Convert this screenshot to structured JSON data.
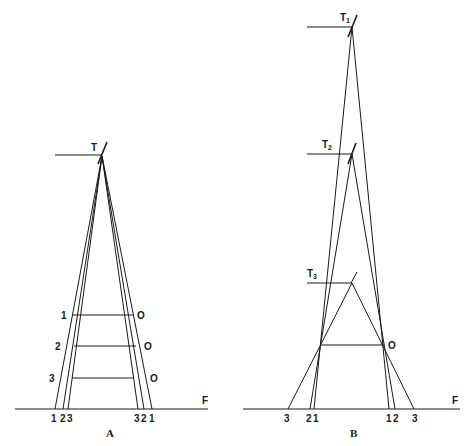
{
  "diagram": {
    "panels": [
      {
        "id": "A",
        "caption": "A",
        "apex_label": "T",
        "ground_label": "F",
        "left_labels": [
          "1",
          "2",
          "3"
        ],
        "right_labels": [
          "O",
          "O",
          "O"
        ],
        "ground_left_labels": [
          "1",
          "2",
          "3"
        ],
        "ground_right_labels": [
          "3",
          "2",
          "1"
        ]
      },
      {
        "id": "B",
        "caption": "B",
        "apex_labels": [
          {
            "main": "T",
            "sub": "1"
          },
          {
            "main": "T",
            "sub": "2"
          },
          {
            "main": "T",
            "sub": "3"
          }
        ],
        "ground_label": "F",
        "object_label": "O",
        "ground_left_labels": [
          "3",
          "2",
          "1"
        ],
        "ground_right_labels": [
          "1",
          "2",
          "3"
        ]
      }
    ]
  }
}
